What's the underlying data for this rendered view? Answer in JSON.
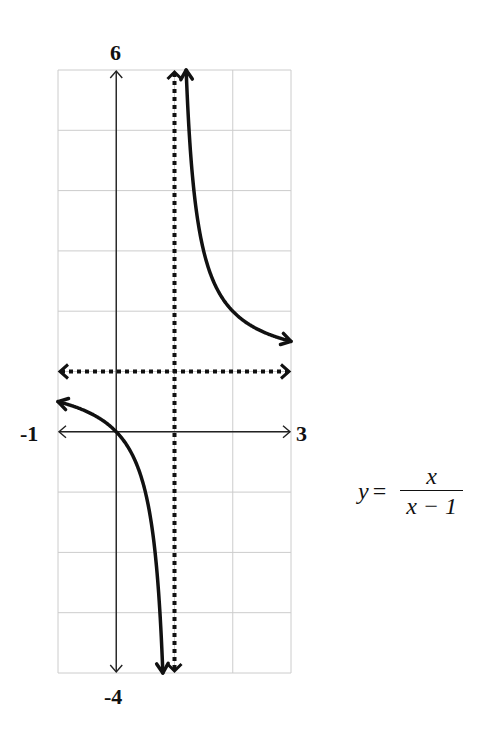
{
  "chart_data": {
    "type": "line",
    "title": "",
    "equation": {
      "lhs": "y",
      "eq": "=",
      "numerator": "x",
      "denominator": "x − 1"
    },
    "xlabel": "",
    "ylabel": "",
    "xlim": [
      -1,
      3
    ],
    "ylim": [
      -4,
      6
    ],
    "grid": true,
    "grid_step": 1,
    "tick_labels": {
      "x_min": "-1",
      "x_max": "3",
      "y_max": "6",
      "y_min": "-4"
    },
    "asymptotes": [
      {
        "type": "vertical",
        "x": 1,
        "style": "dotted"
      },
      {
        "type": "horizontal",
        "y": 1,
        "style": "dotted"
      }
    ],
    "series": [
      {
        "name": "left branch",
        "function": "x/(x-1)",
        "domain": [
          -1,
          0.8
        ],
        "points": [
          [
            -1,
            0.5
          ],
          [
            -0.5,
            0.333
          ],
          [
            0,
            0
          ],
          [
            0.5,
            -1
          ],
          [
            0.75,
            -3
          ],
          [
            0.8,
            -4
          ]
        ]
      },
      {
        "name": "right branch",
        "function": "x/(x-1)",
        "domain": [
          1.2,
          3
        ],
        "points": [
          [
            1.2,
            6
          ],
          [
            1.5,
            3
          ],
          [
            2,
            2
          ],
          [
            2.5,
            1.667
          ],
          [
            3,
            1.5
          ]
        ]
      }
    ],
    "colors": {
      "curve": "#111111",
      "axis": "#222222",
      "grid": "#cccccc"
    }
  }
}
